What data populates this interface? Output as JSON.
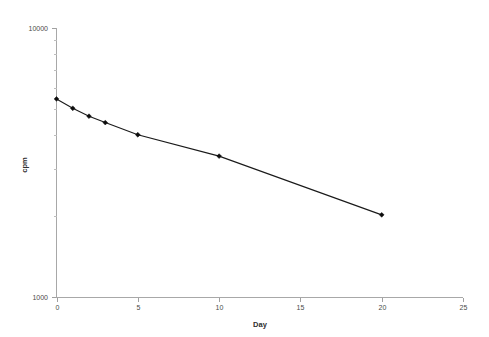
{
  "chart_data": {
    "type": "line",
    "title": "",
    "subtitle": "",
    "xlabel": "Day",
    "ylabel": "cpm",
    "xlim": [
      0,
      25
    ],
    "ylim": [
      1000,
      10000
    ],
    "yscale": "log",
    "xscale": "linear",
    "grid": false,
    "legend": "none",
    "x_ticks": [
      0,
      5,
      10,
      15,
      20,
      25
    ],
    "x_tick_labels": [
      "0",
      "5",
      "10",
      "15",
      "20",
      "25"
    ],
    "y_ticks": [
      1000,
      10000
    ],
    "y_tick_labels": [
      "1000",
      "10000"
    ],
    "y_minor_ticks": [
      2000,
      3000,
      4000,
      5000,
      6000,
      7000,
      8000,
      9000
    ],
    "marker": "filled-diamond",
    "line_color": "#1a1a1a",
    "marker_color": "#0d0d0d",
    "axis_color": "#a8a8a8",
    "background_color": "#ffffff",
    "series": [
      {
        "name": "cpm",
        "x": [
          0,
          1,
          2,
          3,
          5,
          10,
          20
        ],
        "values": [
          5450,
          5030,
          4700,
          4450,
          4010,
          3340,
          2020
        ]
      }
    ],
    "points": [
      {
        "x": 0,
        "y": 5450
      },
      {
        "x": 1,
        "y": 5030
      },
      {
        "x": 2,
        "y": 4700
      },
      {
        "x": 3,
        "y": 4450
      },
      {
        "x": 5,
        "y": 4010
      },
      {
        "x": 10,
        "y": 3340
      },
      {
        "x": 20,
        "y": 2020
      }
    ],
    "annotations": []
  },
  "axes": {
    "x_title": "Day",
    "y_title": "cpm",
    "y_top_label": "10000",
    "y_bottom_label": "1000"
  }
}
